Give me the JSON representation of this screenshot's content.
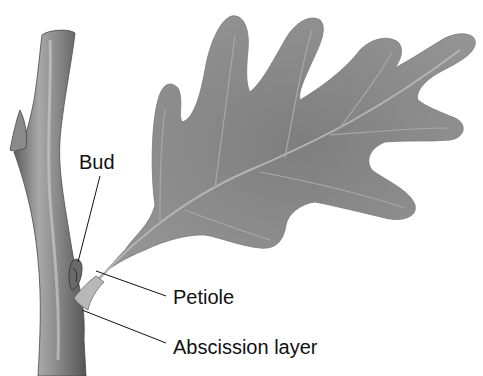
{
  "diagram": {
    "labels": [
      {
        "id": "bud",
        "text": "Bud"
      },
      {
        "id": "petiole",
        "text": "Petiole"
      },
      {
        "id": "abscission",
        "text": "Abscission layer"
      }
    ]
  },
  "colors": {
    "background": "#ffffff",
    "leaf": "#8c8c8c",
    "leaf_vein": "#b0b0b0",
    "twig": "#7a7a7a",
    "twig_highlight": "#bdbdbd",
    "leader_line": "#111111",
    "text": "#111111"
  }
}
